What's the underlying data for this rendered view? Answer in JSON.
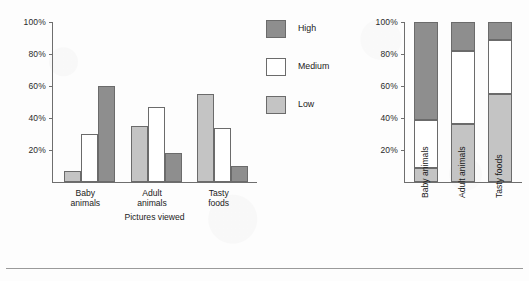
{
  "figure": {
    "background_color": "#fdfdfd",
    "rule_color": "#9a9a9a"
  },
  "legend": {
    "position": "center",
    "items": [
      {
        "label": "High",
        "color": "#8e8e8e",
        "key": "high"
      },
      {
        "label": "Medium",
        "color": "#ffffff",
        "key": "medium"
      },
      {
        "label": "Low",
        "color": "#c4c4c4",
        "key": "low"
      }
    ]
  },
  "chart_data": [
    {
      "id": "grouped-bar-chart",
      "type": "bar",
      "title": "",
      "xlabel": "Pictures viewed",
      "ylabel": "",
      "ylim": [
        0,
        100
      ],
      "yticks": [
        20,
        40,
        60,
        80,
        100
      ],
      "ytick_labels": [
        "20%",
        "40%",
        "60%",
        "80%",
        "100%"
      ],
      "grid": false,
      "legend_position": "center",
      "categories": [
        "Baby\nanimals",
        "Adult\nanimals",
        "Tasty\nfoods"
      ],
      "category_labels_plain": [
        "Baby animals",
        "Adult animals",
        "Tasty foods"
      ],
      "series": [
        {
          "name": "Low",
          "color": "#c4c4c4",
          "values": [
            7,
            35,
            55
          ]
        },
        {
          "name": "Medium",
          "color": "#ffffff",
          "values": [
            30,
            47,
            34
          ]
        },
        {
          "name": "High",
          "color": "#8e8e8e",
          "values": [
            60,
            18,
            10
          ]
        }
      ]
    },
    {
      "id": "stacked-bar-chart",
      "type": "bar",
      "stacked": true,
      "title": "",
      "xlabel": "",
      "ylabel": "",
      "ylim": [
        0,
        100
      ],
      "yticks": [
        20,
        40,
        60,
        80,
        100
      ],
      "ytick_labels": [
        "20%",
        "40%",
        "60%",
        "80%",
        "100%"
      ],
      "grid": false,
      "legend_position": "shared-center",
      "categories": [
        "Baby animals",
        "Adult animals",
        "Tasty foods"
      ],
      "series": [
        {
          "name": "Low",
          "color": "#c4c4c4",
          "values": [
            9,
            36,
            55
          ]
        },
        {
          "name": "Medium",
          "color": "#ffffff",
          "values": [
            30,
            46,
            34
          ]
        },
        {
          "name": "High",
          "color": "#8e8e8e",
          "values": [
            61,
            18,
            11
          ]
        }
      ]
    }
  ]
}
